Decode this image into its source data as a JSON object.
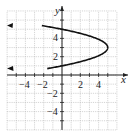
{
  "chart_data": {
    "type": "line",
    "title": "",
    "xlabel": "x",
    "ylabel": "y",
    "xlim": [
      -6,
      6
    ],
    "ylim": [
      -6,
      7
    ],
    "grid": true,
    "x_ticks": [
      -4,
      -2,
      2,
      4
    ],
    "y_ticks": [
      4,
      2,
      -2,
      -4
    ],
    "series": [
      {
        "name": "parabola x = 5 - 1.25(y - 3)^2",
        "description": "Horizontal parabola opening left, vertex (5, 3), arrows on both ends",
        "vertex": [
          5,
          3
        ],
        "points": [
          [
            -6,
            5.97
          ],
          [
            -5,
            5.83
          ],
          [
            -4,
            5.68
          ],
          [
            -3,
            5.53
          ],
          [
            -2,
            5.37
          ],
          [
            -1,
            5.19
          ],
          [
            0,
            5.0
          ],
          [
            1,
            4.79
          ],
          [
            2,
            4.55
          ],
          [
            3,
            4.26
          ],
          [
            4,
            3.89
          ],
          [
            5,
            3.0
          ],
          [
            4,
            2.11
          ],
          [
            3,
            1.74
          ],
          [
            2,
            1.45
          ],
          [
            1,
            1.21
          ],
          [
            0,
            1.0
          ],
          [
            -1,
            0.81
          ],
          [
            -2,
            0.63
          ],
          [
            -3,
            0.47
          ],
          [
            -4,
            0.32
          ],
          [
            -5,
            0.17
          ],
          [
            -6,
            0.03
          ]
        ],
        "color": "#111111"
      }
    ]
  },
  "labels": {
    "x_axis": "x",
    "y_axis": "y",
    "x_tick_labels": [
      "−4",
      "−2",
      "2",
      "4"
    ],
    "y_tick_labels": [
      "4",
      "2",
      "−2",
      "−4"
    ]
  }
}
